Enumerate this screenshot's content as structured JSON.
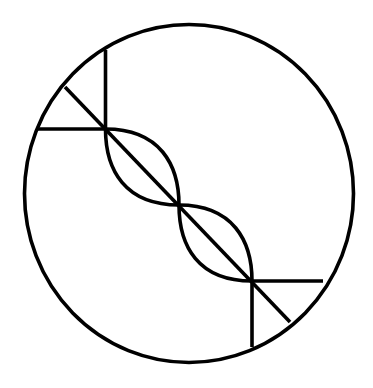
{
  "diagram": {
    "stroke_color": "#000000",
    "background_color": "#ffffff",
    "stroke_width": 3.6,
    "outer_circle": {
      "cx": 189,
      "cy": 193.5,
      "rx": 164.5,
      "ry": 169
    },
    "diagonal_axis": {
      "x1": 65,
      "y1": 87,
      "x2": 290,
      "y2": 322
    },
    "top_left_tick": {
      "vertical": {
        "x1": 105.5,
        "y1": 50,
        "x2": 105.5,
        "y2": 129
      },
      "horizontal": {
        "x1": 38,
        "y1": 129,
        "x2": 105.5,
        "y2": 129
      }
    },
    "bottom_right_tick": {
      "vertical": {
        "x1": 252,
        "y1": 281,
        "x2": 252,
        "y2": 347
      },
      "horizontal": {
        "x1": 252,
        "y1": 281,
        "x2": 323,
        "y2": 281
      }
    },
    "junctions": [
      {
        "x": 105.5,
        "y": 129
      },
      {
        "x": 179,
        "y": 205
      },
      {
        "x": 252,
        "y": 281
      }
    ],
    "lenses": [
      {
        "upper_path": "M105.5,129 C160,129 179,165 179,205",
        "lower_path": "M105.5,129 C105.5,170 125,205 179,205"
      },
      {
        "upper_path": "M179,205 C233,205 252,241 252,281",
        "lower_path": "M179,205 C179,246 198,281 252,281"
      }
    ]
  }
}
